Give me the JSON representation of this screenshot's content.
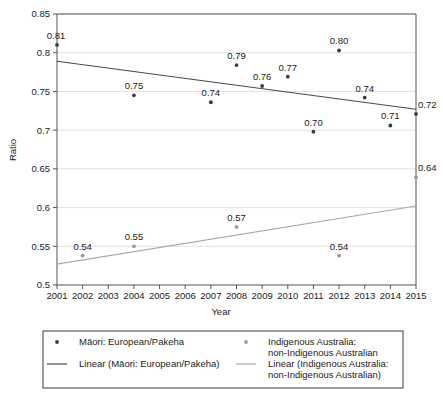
{
  "chart_data": {
    "type": "scatter",
    "title": "",
    "xlabel": "Year",
    "ylabel": "Ratio",
    "xlim": [
      2001,
      2015
    ],
    "ylim": [
      0.5,
      0.85
    ],
    "grid": true,
    "legend_position": "bottom",
    "x_ticks": [
      "2001",
      "2002",
      "2003",
      "2004",
      "2005",
      "2006",
      "2007",
      "2008",
      "2009",
      "2010",
      "2011",
      "2012",
      "2013",
      "2014",
      "2015"
    ],
    "y_ticks": [
      "0.5",
      "0.55",
      "0.6",
      "0.65",
      "0.7",
      "0.75",
      "0.8",
      "0.85"
    ],
    "series": [
      {
        "name": "Māori: European/Pakeha",
        "marker": "dot",
        "color": "#3b3b3b",
        "points": [
          {
            "x": 2001,
            "y": 0.81,
            "label": "0.81"
          },
          {
            "x": 2004,
            "y": 0.745,
            "label": "0.75"
          },
          {
            "x": 2007,
            "y": 0.736,
            "label": "0.74"
          },
          {
            "x": 2008,
            "y": 0.784,
            "label": "0.79"
          },
          {
            "x": 2009,
            "y": 0.757,
            "label": "0.76"
          },
          {
            "x": 2010,
            "y": 0.769,
            "label": "0.77"
          },
          {
            "x": 2011,
            "y": 0.698,
            "label": "0.70"
          },
          {
            "x": 2012,
            "y": 0.803,
            "label": "0.80"
          },
          {
            "x": 2013,
            "y": 0.742,
            "label": "0.74"
          },
          {
            "x": 2014,
            "y": 0.706,
            "label": "0.71"
          },
          {
            "x": 2015,
            "y": 0.721,
            "label": "0.72"
          }
        ]
      },
      {
        "name": "Indigenous Australia: non-Indigenous Australian",
        "marker": "dot",
        "color": "#9a9a9a",
        "points": [
          {
            "x": 2002,
            "y": 0.538,
            "label": "0.54"
          },
          {
            "x": 2004,
            "y": 0.55,
            "label": "0.55"
          },
          {
            "x": 2008,
            "y": 0.575,
            "label": "0.57"
          },
          {
            "x": 2012,
            "y": 0.538,
            "label": "0.54"
          },
          {
            "x": 2015,
            "y": 0.639,
            "label": "0.64"
          }
        ]
      }
    ],
    "trendlines": [
      {
        "name": "Linear (Māori: European/Pakeha)",
        "color": "#4a4a4a",
        "x_start": 2001,
        "y_start": 0.789,
        "x_end": 2015,
        "y_end": 0.727
      },
      {
        "name": "Linear (Indigenous Australia: non-Indigenous Australian)",
        "color": "#a8a8a8",
        "x_start": 2001,
        "y_start": 0.527,
        "x_end": 2015,
        "y_end": 0.602
      }
    ]
  },
  "legend": {
    "entries": [
      {
        "marker": "dot",
        "color": "#3b3b3b",
        "line1": "Māori: European/Pakeha",
        "line2": ""
      },
      {
        "marker": "dot",
        "color": "#9a9a9a",
        "line1": "Indigenous Australia:",
        "line2": "non-Indigenous Australian"
      },
      {
        "marker": "line",
        "color": "#4a4a4a",
        "line1": "Linear (Māori: European/Pakeha)",
        "line2": ""
      },
      {
        "marker": "line",
        "color": "#a8a8a8",
        "line1": "Linear (Indigenous Australia:",
        "line2": "non-Indigenous Australian)"
      }
    ]
  },
  "colors": {
    "axis": "#555555",
    "grid": "#d8d8d8",
    "text": "#1a1a1a",
    "background": "#ffffff"
  }
}
